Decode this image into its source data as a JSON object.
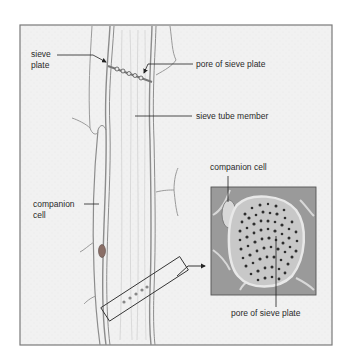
{
  "figure": {
    "colors": {
      "background": "#ffffff",
      "frame_fill": "#f1f1f1",
      "frame_border": "#7a7a7a",
      "cell_wall": "#8c8c8c",
      "inset_fill": "#9a9a9a",
      "pore_dark": "#3a3a3a",
      "label_text": "#2a2a2a"
    }
  },
  "labels": {
    "sieve_plate_line1": "sieve",
    "sieve_plate_line2": "plate",
    "pore_top": "pore of sieve plate",
    "sieve_tube_member": "sieve tube member",
    "companion_cell_left_line1": "companion",
    "companion_cell_left_line2": "cell",
    "companion_cell_inset": "companion cell",
    "pore_inset": "pore of sieve plate"
  },
  "inset": {
    "description": "cross-section of sieve plate (magnified)",
    "pore_count_approx": 80
  }
}
